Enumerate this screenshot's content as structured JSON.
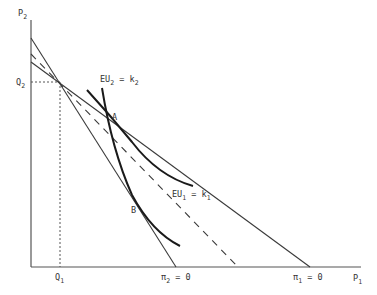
{
  "diagram": {
    "axes": {
      "y_label": "P",
      "y_label_sub": "2",
      "x_label": "P",
      "x_label_sub": "1"
    },
    "ticks": {
      "q2": "Q",
      "q2_sub": "2",
      "q1": "Q",
      "q1_sub": "1"
    },
    "lines": {
      "pi2_zero": "π",
      "pi2_zero_sub": "2",
      "pi2_zero_eq": " = 0",
      "pi1_zero": "π",
      "pi1_zero_sub": "1",
      "pi1_zero_eq": " = 0"
    },
    "curves": {
      "eu2_main": "EU",
      "eu2_sub": "2",
      "eu2_eq": " = k",
      "eu2_k_sub": "2",
      "eu1_main": "EU",
      "eu1_sub": "1",
      "eu1_eq": " = k",
      "eu1_k_sub": "1"
    },
    "points": {
      "a": "A",
      "b": "B"
    },
    "colors": {
      "ink": "#1a1a1a",
      "line": "#3a3a3a",
      "background": "#ffffff"
    }
  }
}
